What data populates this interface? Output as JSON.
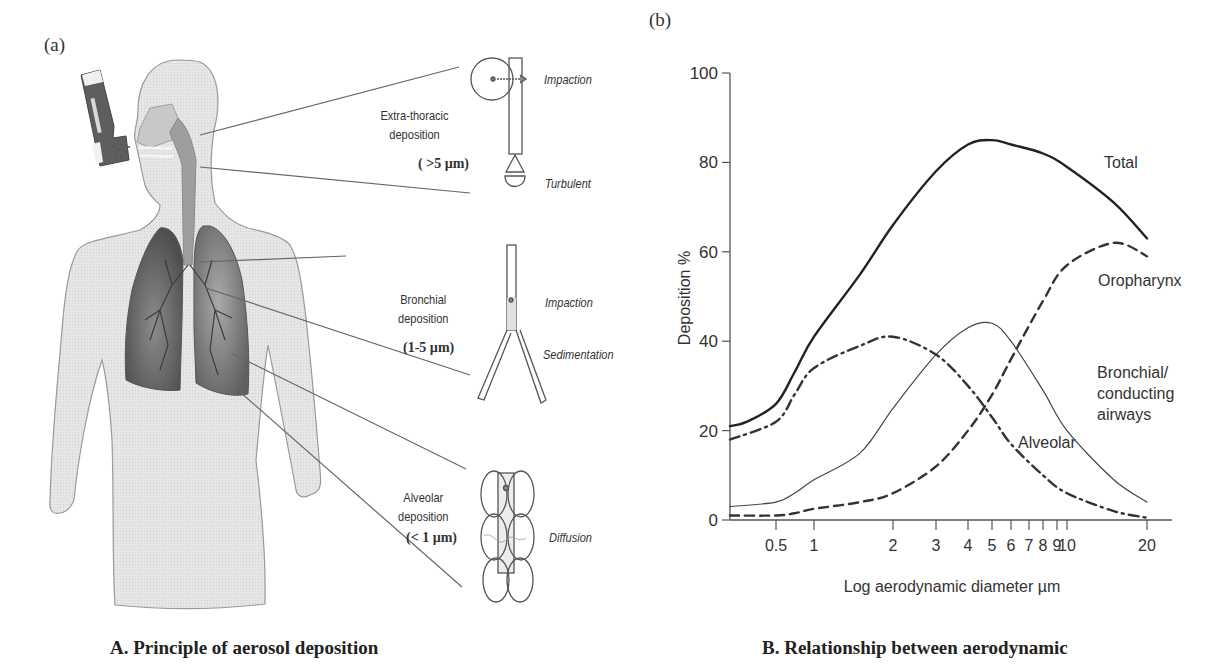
{
  "panel_a": {
    "label": "(a)",
    "regions": [
      {
        "name": "Extra-thoracic",
        "line1": "Extra-thoracic",
        "line2": "deposition",
        "size": "( >5 µm)",
        "mechanisms": [
          "Impaction",
          "Turbulent"
        ]
      },
      {
        "name": "Bronchial",
        "line1": "Bronchial",
        "line2": "deposition",
        "size": "(1-5 µm)",
        "mechanisms": [
          "Impaction",
          "Sedimentation"
        ]
      },
      {
        "name": "Alveolar",
        "line1": "Alveolar",
        "line2": "deposition",
        "size": "(< 1 µm)",
        "mechanisms": [
          "Diffusion"
        ]
      }
    ],
    "caption": "A. Principle of aerosol deposition"
  },
  "panel_b": {
    "label": "(b)",
    "caption": "B. Relationship between aerodynamic"
  },
  "colors": {
    "body_fill": "#e2e2e2",
    "body_outline": "#8a8a8a",
    "lung_fill": "#6b6b6b",
    "ink": "#333333"
  },
  "chart_data": {
    "type": "line",
    "title": "",
    "xlabel": "Log aerodynamic diameter µm",
    "ylabel": "Deposition %",
    "xscale": "log",
    "xlim": [
      0.35,
      25
    ],
    "ylim": [
      0,
      100
    ],
    "yticks": [
      0,
      20,
      40,
      60,
      80,
      100
    ],
    "ytick_labels": [
      "0",
      "20",
      "40",
      "60",
      "80",
      "100"
    ],
    "xticks": [
      0.5,
      1,
      2,
      3,
      4,
      5,
      6,
      7,
      8,
      9,
      10,
      20
    ],
    "xtick_labels": [
      "0.5",
      "1",
      "2",
      "3",
      "4",
      "5",
      "6",
      "7",
      "8",
      "9",
      "10",
      "20"
    ],
    "grid": false,
    "legend": "inline labels",
    "series": [
      {
        "name": "Total",
        "style": "solid-thick",
        "label": "Total",
        "x": [
          0.35,
          0.4,
          0.5,
          0.7,
          1,
          1.5,
          2,
          3,
          4,
          5,
          6,
          8,
          10,
          15,
          20
        ],
        "y": [
          21,
          22,
          26,
          33,
          41,
          55,
          66,
          78,
          84,
          85,
          84,
          82,
          79,
          71,
          63
        ]
      },
      {
        "name": "Oropharynx",
        "style": "dashed",
        "label": "Oropharynx",
        "x": [
          0.35,
          0.5,
          0.7,
          1,
          1.5,
          2,
          3,
          4,
          5,
          6,
          8,
          10,
          15,
          20
        ],
        "y": [
          1,
          1,
          1.5,
          2.5,
          4,
          6,
          12,
          20,
          28,
          36,
          49,
          57,
          62,
          59
        ]
      },
      {
        "name": "Bronchial/conducting airways",
        "style": "solid-thin",
        "label": "Bronchial/\nconducting\nairways",
        "x": [
          0.35,
          0.5,
          0.7,
          1,
          1.5,
          2,
          3,
          4,
          5,
          6,
          8,
          10,
          15,
          20
        ],
        "y": [
          3,
          4,
          6,
          9,
          15,
          25,
          37,
          43,
          44,
          40,
          29,
          20,
          9,
          4
        ]
      },
      {
        "name": "Alveolar",
        "style": "dash-dot",
        "label": "Alveolar",
        "x": [
          0.35,
          0.5,
          0.7,
          1,
          1.5,
          2,
          3,
          4,
          5,
          6,
          8,
          10,
          15,
          20
        ],
        "y": [
          18,
          22,
          28,
          34,
          39,
          41,
          37,
          30,
          23,
          17,
          10,
          6,
          2,
          0.5
        ]
      }
    ]
  }
}
